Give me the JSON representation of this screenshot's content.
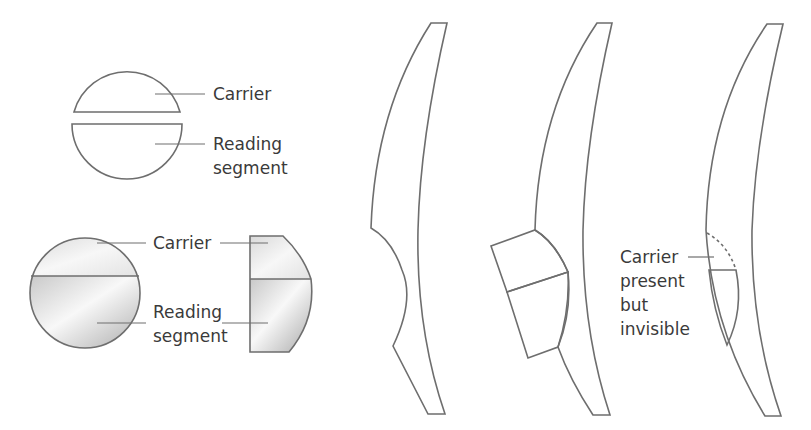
{
  "diagram": {
    "colors": {
      "outline": "#6e6e6e",
      "fill_light": "#f4f4f4",
      "fill_mid": "#d8d8d8",
      "fill_dark": "#bdbdbd",
      "text": "#3a3a3a"
    },
    "panels": [
      {
        "id": "exploded-components",
        "labels": {
          "carrier": "Carrier",
          "segment_line1": "Reading",
          "segment_line2": "segment"
        }
      },
      {
        "id": "assembled-front-and-side",
        "labels": {
          "carrier": "Carrier",
          "segment_line1": "Reading",
          "segment_line2": "segment"
        }
      },
      {
        "id": "lens-with-recess",
        "labels": {}
      },
      {
        "id": "lens-with-bonded-segment",
        "labels": {}
      },
      {
        "id": "lens-with-invisible-carrier",
        "labels": {
          "line1": "Carrier",
          "line2": "present",
          "line3": "but",
          "line4": "invisible"
        }
      }
    ]
  }
}
